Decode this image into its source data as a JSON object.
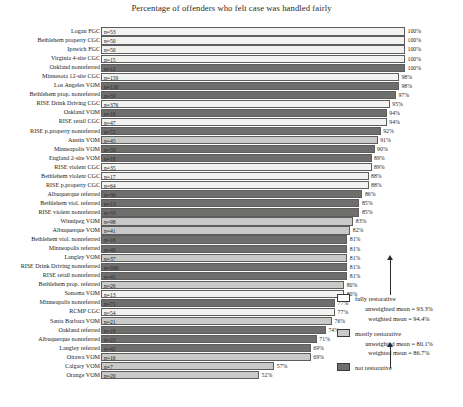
{
  "chart_data": {
    "type": "bar",
    "orientation": "horizontal",
    "title": "Percentage of offenders who felt case was handled fairly",
    "xlabel": "",
    "ylabel": "",
    "xlim": [
      0,
      100
    ],
    "grid": false,
    "legend_position": "right-inside",
    "value_suffix": "%",
    "categories": [
      "Logan FGC",
      "Bethlehem property CGC",
      "Ipswich FGC",
      "Virginia 4-site CGC",
      "Oakland nonreferred",
      "Minnesota 12-site CGC",
      "Los Angeles VOM",
      "Bethlehem prop. nonreferred",
      "RISE Drink Driving CGC",
      "Oakland VOM",
      "RISE retail CGC",
      "RISE p.property nonreferred",
      "Austin VOM",
      "Minneapolis VOM",
      "England 2-site VOM",
      "RISE violent CGC",
      "Bethlehem violent CGC",
      "RISE p.property CGC",
      "Albuquerque referred",
      "Bethlehem viol. referred",
      "RISE violent nonreferred",
      "Winnipeg VOM",
      "Albuquerque VOM",
      "Bethlehem viol. nonreferred",
      "Minneapolis referred",
      "Langley VOM",
      "RISE Drink Driving nonreferred",
      "RISE retail nonreferred",
      "Bethlehem prop. referred",
      "Sonoma VOM",
      "Minneapolis nonreferred",
      "RCMP CGC",
      "Santa Barbara VOM",
      "Oakland referred",
      "Albuquerque nonreferred",
      "Langley referred",
      "Ottawa VOM",
      "Calgary VOM",
      "Orange VOM"
    ],
    "values": [
      100,
      100,
      100,
      100,
      100,
      98,
      98,
      97,
      95,
      94,
      94,
      92,
      91,
      90,
      89,
      89,
      88,
      88,
      86,
      85,
      85,
      83,
      82,
      81,
      81,
      81,
      81,
      81,
      80,
      80,
      77,
      77,
      76,
      74,
      71,
      69,
      69,
      57,
      52
    ],
    "n_labels": [
      "n=53",
      "n=50",
      "n=50",
      "n=15",
      "n=12",
      "n=159",
      "n=130",
      "n=30",
      "n=376",
      "n=16",
      "n=47",
      "n=72",
      "n=45",
      "n=50",
      "n=18",
      "n=35",
      "n=17",
      "n=64",
      "n=36",
      "n=13",
      "n=33",
      "n=98",
      "n=41",
      "n=16",
      "n=40",
      "n=37",
      "n=349",
      "n=41",
      "n=26",
      "n=13",
      "n=71",
      "n=54",
      "n=21",
      "n=19",
      "n=23",
      "n=42",
      "n=16",
      "n=7",
      "n=20"
    ],
    "groups": [
      "full",
      "full",
      "full",
      "full",
      "not",
      "full",
      "not",
      "not",
      "full",
      "not",
      "full",
      "not",
      "mostly",
      "not",
      "not",
      "full",
      "full",
      "full",
      "not",
      "not",
      "not",
      "mostly",
      "mostly",
      "not",
      "not",
      "mostly",
      "not",
      "not",
      "mostly",
      "full",
      "not",
      "full",
      "mostly",
      "not",
      "not",
      "not",
      "mostly",
      "mostly",
      "mostly"
    ]
  },
  "legend": {
    "items": [
      {
        "key": "full",
        "label": "fully restorative",
        "swatch_color": "#ffffff",
        "unweighted_mean": "unweighted mean = 93.3%",
        "weighted_mean": "weighted mean = 94.4%"
      },
      {
        "key": "mostly",
        "label": "mostly restorative",
        "swatch_color": "#c9c9c7",
        "unweighted_mean": "unweighted mean = 80.1%",
        "weighted_mean": "weighted mean = 86.7%"
      },
      {
        "key": "not",
        "label": "not restorative",
        "swatch_color": "#6e6e6c",
        "unweighted_mean": "",
        "weighted_mean": ""
      }
    ]
  }
}
